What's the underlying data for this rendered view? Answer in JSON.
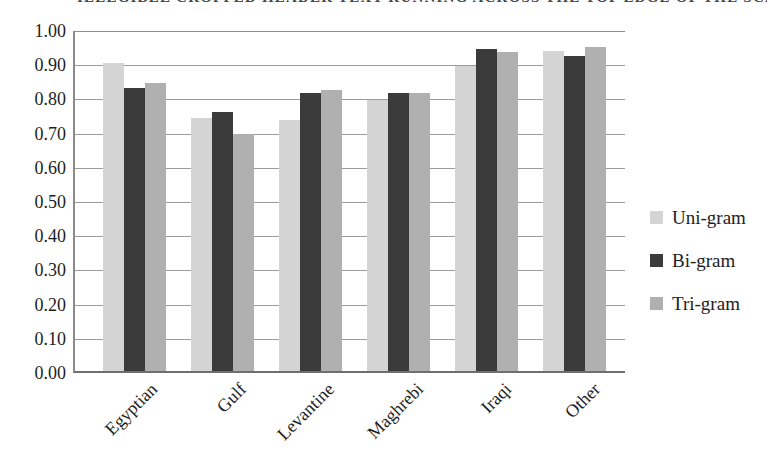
{
  "cropped_text_fragment": "ILLEGIBLE CROPPED HEADER TEXT RUNNING ACROSS THE TOP EDGE OF THE SCANNED FIGURE IMAGE",
  "chart_data": {
    "type": "bar",
    "title": "",
    "xlabel": "",
    "ylabel": "",
    "categories": [
      "Egyptian",
      "Gulf",
      "Levantine",
      "Maghrebi",
      "Iraqi",
      "Other"
    ],
    "series": [
      {
        "name": "Uni-gram",
        "color": "#d4d4d4",
        "values": [
          0.91,
          0.745,
          0.74,
          0.8,
          0.9,
          0.945
        ]
      },
      {
        "name": "Bi-gram",
        "color": "#3b3b3b",
        "values": [
          0.835,
          0.765,
          0.82,
          0.82,
          0.95,
          0.93
        ]
      },
      {
        "name": "Tri-gram",
        "color": "#b0b0b0",
        "values": [
          0.85,
          0.7,
          0.83,
          0.82,
          0.94,
          0.955
        ]
      }
    ],
    "ylim": [
      0,
      1
    ],
    "ytick_step": 0.1,
    "ytick_labels": [
      "1.00",
      "0.90",
      "0.80",
      "0.70",
      "0.60",
      "0.50",
      "0.40",
      "0.30",
      "0.20",
      "0.10",
      "0.00"
    ],
    "grid": true,
    "legend_position": "right"
  },
  "colors": {
    "gridline": "#9b9b9b",
    "axis": "#8a8a8a",
    "text": "#1d1d1d"
  }
}
